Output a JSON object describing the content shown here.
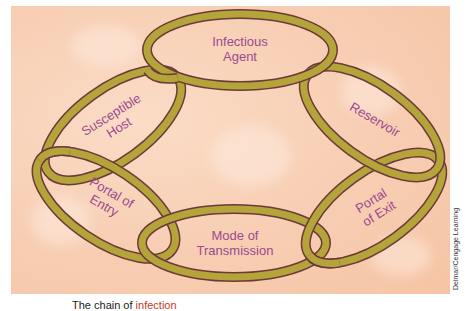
{
  "figure": {
    "title": "The chain of infection",
    "caption_prefix": "The chain of ",
    "caption_highlight": "infection",
    "credit": "Delmar/Cengage Learning",
    "colors": {
      "background": "#f8d0b6",
      "ring_fill": "#b5a43a",
      "ring_outline": "#6b3a3a",
      "label_text": "#9b4a8f"
    },
    "links": [
      {
        "id": "infectious-agent",
        "line1": "Infectious",
        "line2": "Agent"
      },
      {
        "id": "reservoir",
        "line1": "Reservoir",
        "line2": ""
      },
      {
        "id": "portal-of-exit",
        "line1": "Portal",
        "line2": "of Exit"
      },
      {
        "id": "mode-of-transmission",
        "line1": "Mode of",
        "line2": "Transmission"
      },
      {
        "id": "portal-of-entry",
        "line1": "Portal of",
        "line2": "Entry"
      },
      {
        "id": "susceptible-host",
        "line1": "Susceptible",
        "line2": "Host"
      }
    ]
  }
}
